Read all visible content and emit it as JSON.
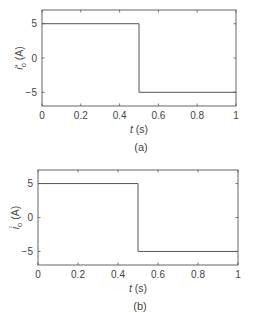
{
  "chart_data": [
    {
      "type": "line",
      "panel_label": "(a)",
      "title": "",
      "xlabel": "t (s)",
      "ylabel": "i_o* (A)",
      "ylabel_main": "i",
      "ylabel_sub": "o",
      "ylabel_sup": "*",
      "ylabel_unit": "(A)",
      "xlim": [
        0,
        1
      ],
      "ylim": [
        -7,
        7
      ],
      "xticks": [
        0,
        0.2,
        0.4,
        0.6,
        0.8,
        1
      ],
      "xtick_labels": [
        "0",
        "0.2",
        "0.4",
        "0.6",
        "0.8",
        "1"
      ],
      "yticks": [
        5,
        0,
        -5
      ],
      "ytick_labels": [
        "5",
        "0",
        "−5"
      ],
      "grid": false,
      "series": [
        {
          "name": "i_o*",
          "x": [
            0,
            0.5,
            0.5,
            1
          ],
          "y": [
            5,
            5,
            -5,
            -5
          ]
        }
      ]
    },
    {
      "type": "line",
      "panel_label": "(b)",
      "title": "",
      "xlabel": "t (s)",
      "ylabel": "i̇_o (A)",
      "ylabel_main": "i̇",
      "ylabel_sub": "o",
      "ylabel_sup": "",
      "ylabel_unit": "(A)",
      "xlim": [
        0,
        1
      ],
      "ylim": [
        -7,
        7
      ],
      "xticks": [
        0,
        0.2,
        0.4,
        0.6,
        0.8,
        1
      ],
      "xtick_labels": [
        "0",
        "0.2",
        "0.4",
        "0.6",
        "0.8",
        "1"
      ],
      "yticks": [
        5,
        0,
        -5
      ],
      "ytick_labels": [
        "5",
        "0",
        "−5"
      ],
      "grid": false,
      "series": [
        {
          "name": "i̇_o",
          "x": [
            0,
            0.5,
            0.5,
            1
          ],
          "y": [
            5,
            5,
            -5,
            -5
          ]
        }
      ]
    }
  ],
  "colors": {
    "axis": "#555555",
    "line": "#555555",
    "text": "#444444"
  }
}
